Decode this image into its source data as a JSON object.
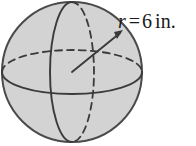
{
  "figure": {
    "name": "sphere-diagram",
    "shape": "sphere",
    "fill_color": "#d3d3d3",
    "outline_color": "#4a4a4a",
    "line_color": "#3a3a3a",
    "background_color": "#ffffff",
    "circle": {
      "center_x": 72,
      "center_y": 72,
      "radius": 70
    },
    "meridian_ellipse": {
      "rx": 22,
      "ry": 70,
      "solid_half": "left",
      "dashed_half": "right"
    },
    "equator_ellipse": {
      "rx": 70,
      "ry": 22,
      "solid_half": "front-bottom",
      "dashed_half": "back-top"
    },
    "radius_arrow": {
      "from_x": 72,
      "from_y": 72,
      "to_x": 122,
      "to_y": 31,
      "has_arrowhead": true
    }
  },
  "label": {
    "variable": "r",
    "equals": "=",
    "value": "6",
    "unit": "in.",
    "full_text": "r = 6 in."
  }
}
